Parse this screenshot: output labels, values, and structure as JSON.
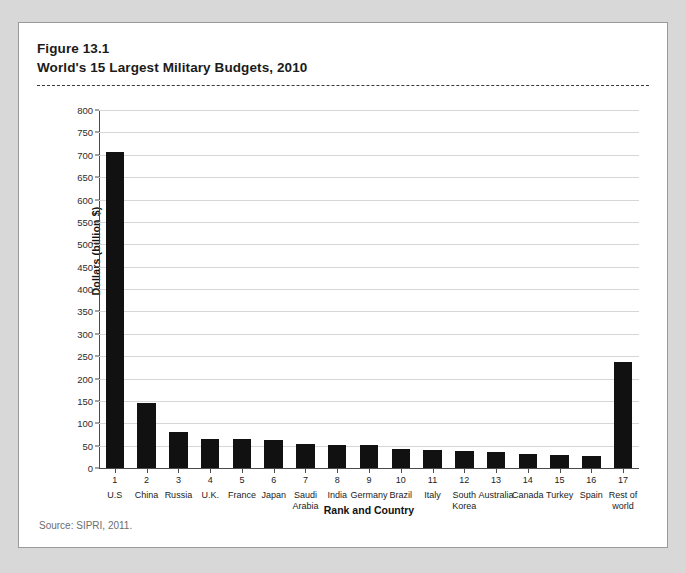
{
  "figure": {
    "number_line": "Figure 13.1",
    "title_line": "World's 15 Largest Military Budgets, 2010",
    "source": "Source: SIPRI, 2011."
  },
  "chart_data": {
    "type": "bar",
    "title": "World's 15 Largest Military Budgets, 2010",
    "subtitle": "Figure 13.1",
    "xlabel": "Rank and Country",
    "ylabel": "Dollars (billion $)",
    "ylim": [
      0,
      800
    ],
    "ytick_step": 50,
    "yticks": [
      0,
      50,
      100,
      150,
      200,
      250,
      300,
      350,
      400,
      450,
      500,
      550,
      600,
      650,
      700,
      750,
      800
    ],
    "ytick_labels": [
      "0",
      "50",
      "100",
      "150",
      "200",
      "250",
      "300",
      "350",
      "400",
      "450",
      "500",
      "550",
      "600",
      "650",
      "700",
      "750",
      "800"
    ],
    "grid": true,
    "grid_axis": "y",
    "legend": false,
    "bar_color": "#111111",
    "ranks": [
      "1",
      "2",
      "3",
      "4",
      "5",
      "6",
      "7",
      "8",
      "9",
      "10",
      "11",
      "12",
      "13",
      "14",
      "15",
      "16",
      "17"
    ],
    "categories": [
      "U.S",
      "China",
      "Russia",
      "U.K.",
      "France",
      "Japan",
      "Saudi Arabia",
      "India",
      "Germany",
      "Brazil",
      "Italy",
      "South Korea",
      "Australia",
      "Canada",
      "Turkey",
      "Spain",
      "Rest of world"
    ],
    "values": [
      707,
      145,
      80,
      65,
      64,
      62,
      54,
      52,
      51,
      42,
      40,
      38,
      36,
      32,
      28,
      26,
      238
    ],
    "units": "billion US dollars",
    "source": "SIPRI, 2011"
  }
}
